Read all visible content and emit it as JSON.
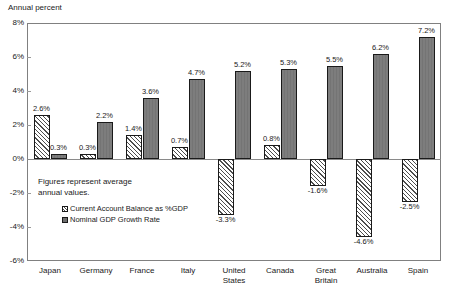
{
  "chart_data": {
    "type": "bar",
    "title": "Annual percent",
    "xlabel": "",
    "ylabel": "Annual percent",
    "ylim": [
      -6,
      8
    ],
    "ytick_labels": [
      "8%",
      "6%",
      "4%",
      "2%",
      "0%",
      "-2%",
      "-4%",
      "-6%"
    ],
    "ytick_values": [
      8,
      6,
      4,
      2,
      0,
      -2,
      -4,
      -6
    ],
    "grid": false,
    "legend_position": "inside-lower-left",
    "categories": [
      "Japan",
      "Germany",
      "France",
      "Italy",
      "United States",
      "Canada",
      "Great Britain",
      "Australia",
      "Spain"
    ],
    "category_lines": [
      [
        "Japan"
      ],
      [
        "Germany"
      ],
      [
        "France"
      ],
      [
        "Italy"
      ],
      [
        "United",
        "States"
      ],
      [
        "Canada"
      ],
      [
        "Great",
        "Britain"
      ],
      [
        "Australia"
      ],
      [
        "Spain"
      ]
    ],
    "series": [
      {
        "name": "Current Account Balance as %GDP",
        "pattern": "diagonal-hatch",
        "values": [
          2.6,
          0.3,
          1.4,
          0.7,
          -3.3,
          0.8,
          -1.6,
          -4.6,
          -2.5
        ],
        "labels": [
          "2.6%",
          "0.3%",
          "1.4%",
          "0.7%",
          "-3.3%",
          "0.8%",
          "-1.6%",
          "-4.6%",
          "-2.5%"
        ]
      },
      {
        "name": "Nominal GDP Growth Rate",
        "pattern": "solid-gray",
        "values": [
          0.3,
          2.2,
          3.6,
          4.7,
          5.2,
          5.3,
          5.5,
          6.2,
          7.2
        ],
        "labels": [
          "0.3%",
          "2.2%",
          "3.6%",
          "4.7%",
          "5.2%",
          "5.3%",
          "5.5%",
          "6.2%",
          "7.2%"
        ]
      }
    ],
    "annotation": {
      "line1": "Figures represent average",
      "line2": "annual values."
    },
    "colors": {
      "series2_fill": "#7d7d7d",
      "series1_fill": "#ffffff",
      "bar_outline": "#1a1a1a",
      "axis": "#808080",
      "text": "#1a1a1a"
    }
  }
}
